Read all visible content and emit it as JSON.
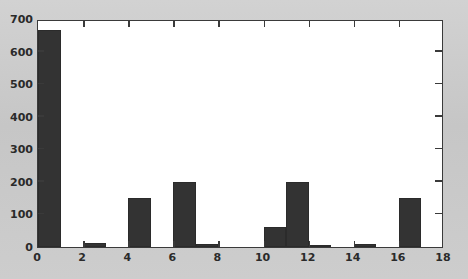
{
  "chart_data": {
    "type": "bar",
    "title": "",
    "subtitle": "",
    "xlabel": "",
    "ylabel": "",
    "xlim": [
      0,
      18
    ],
    "ylim": [
      0,
      700
    ],
    "grid": false,
    "legend": null,
    "bar_width": 1,
    "bar_align": "left",
    "bar_color": "#333333",
    "plot_background": "#ffffff",
    "figure_background": "#c9c9c9",
    "axis_color": "#3a3a3a",
    "xticks": [
      0,
      2,
      4,
      6,
      8,
      10,
      12,
      14,
      16,
      18
    ],
    "xtick_labels": [
      "0",
      "2",
      "4",
      "6",
      "8",
      "10",
      "12",
      "14",
      "16",
      "18"
    ],
    "yticks": [
      0,
      100,
      200,
      300,
      400,
      500,
      600,
      700
    ],
    "ytick_labels": [
      "0",
      "100",
      "200",
      "300",
      "400",
      "500",
      "600",
      "700"
    ],
    "categories": [
      0,
      1,
      2,
      3,
      4,
      5,
      6,
      7,
      8,
      9,
      10,
      11,
      12,
      13,
      14,
      15,
      16,
      17
    ],
    "values": [
      665,
      0,
      12,
      0,
      150,
      0,
      200,
      10,
      0,
      0,
      60,
      200,
      5,
      0,
      10,
      0,
      150,
      0
    ],
    "bars": [
      {
        "x": 0,
        "value": 665
      },
      {
        "x": 2,
        "value": 12
      },
      {
        "x": 4,
        "value": 150
      },
      {
        "x": 6,
        "value": 200
      },
      {
        "x": 7,
        "value": 10
      },
      {
        "x": 10,
        "value": 60
      },
      {
        "x": 11,
        "value": 200
      },
      {
        "x": 12,
        "value": 5
      },
      {
        "x": 14,
        "value": 10
      },
      {
        "x": 16,
        "value": 150
      }
    ]
  }
}
